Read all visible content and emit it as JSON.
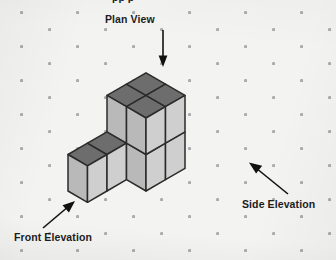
{
  "figure": {
    "kind": "isometric-cube-diagram",
    "background_color": "#f3f3f1",
    "dot_color": "#a8a8a8",
    "partial_top_text": "pp p",
    "labels": {
      "plan_view": "Plan View",
      "front_elevation": "Front Elevation",
      "side_elevation": "Side Elevation"
    },
    "annotations": [
      {
        "name": "plan-view-arrow",
        "label": "Plan View",
        "direction": "down",
        "from": [
          163,
          30
        ],
        "to": [
          163,
          66
        ]
      },
      {
        "name": "front-elevation-arrow",
        "label": "Front Elevation",
        "direction": "up-right",
        "from": [
          44,
          227
        ],
        "to": [
          74,
          202
        ]
      },
      {
        "name": "side-elevation-arrow",
        "label": "Side Elevation",
        "direction": "up-left",
        "from": [
          287,
          193
        ],
        "to": [
          250,
          163
        ]
      }
    ],
    "colors": {
      "top_face": "#6d6d6d",
      "left_face": "#b9b9b9",
      "right_face": "#cfcfcf",
      "outline": "#2b2b2b",
      "arrow": "#111111",
      "text": "#1c1c1c"
    },
    "projection": {
      "origin": [
        68,
        191
      ],
      "u_axis": [
        19.5,
        -11.3
      ],
      "v_axis": [
        19.5,
        11.3
      ],
      "w_axis": [
        0,
        -36.5
      ],
      "note": "u = right-back, v = right-front, w = up"
    },
    "cubes": [
      {
        "id": "c-0-0-0",
        "x": 0,
        "y": 0,
        "z": 0
      },
      {
        "id": "c-1-0-0",
        "x": 1,
        "y": 0,
        "z": 0
      },
      {
        "id": "c-2-0-0",
        "x": 2,
        "y": 0,
        "z": 0
      },
      {
        "id": "c-2-0-1",
        "x": 2,
        "y": 0,
        "z": 1
      },
      {
        "id": "c-3-0-0",
        "x": 3,
        "y": 0,
        "z": 0
      },
      {
        "id": "c-3-0-1",
        "x": 3,
        "y": 0,
        "z": 1
      },
      {
        "id": "c-2-1-0",
        "x": 2,
        "y": 1,
        "z": 0
      },
      {
        "id": "c-2-1-1",
        "x": 2,
        "y": 1,
        "z": 1
      },
      {
        "id": "c-3-1-0",
        "x": 3,
        "y": 1,
        "z": 0
      },
      {
        "id": "c-3-1-1",
        "x": 3,
        "y": 1,
        "z": 1
      }
    ],
    "cube_count": 10
  }
}
